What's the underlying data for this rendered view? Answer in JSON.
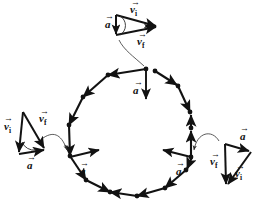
{
  "figure": {
    "width": 259,
    "height": 211,
    "background_color": "#ffffff",
    "ink_color": "#121212",
    "connector_color": "#4a4a4a"
  },
  "path": {
    "shape": "regular-polygon",
    "sides": 16,
    "center_x": 130,
    "center_y": 130,
    "radius": 62,
    "travel_direction": "counterclockwise",
    "edge_arrowheads": true,
    "vertex_dots": true
  },
  "labels": {
    "v_initial": "v",
    "v_initial_sub": "i",
    "v_final": "v",
    "v_final_sub": "f",
    "acceleration": "a",
    "vector_bar": "→"
  },
  "acceleration_markers": [
    {
      "id": "accel-top",
      "position": "top-vertex",
      "label": "a",
      "direction": "down-toward-center",
      "x": 146,
      "y": 70,
      "label_x": 137,
      "label_y": 90
    },
    {
      "id": "accel-left",
      "position": "lower-left-vertex",
      "label": "a",
      "direction": "up-right-toward-center",
      "x": 71,
      "y": 157,
      "label_x": 84,
      "label_y": 176
    },
    {
      "id": "accel-right",
      "position": "lower-right-vertex",
      "label": "a",
      "direction": "up-left-toward-center",
      "x": 190,
      "y": 157,
      "label_x": 180,
      "label_y": 176
    }
  ],
  "vector_triangles": [
    {
      "id": "triangle-top",
      "attached_to": "top-vertex",
      "labels": {
        "v_initial": "v",
        "v_initial_sub": "i",
        "v_final": "v",
        "v_final_sub": "f",
        "acceleration": "a",
        "acceleration_sub": ""
      },
      "label_positions": {
        "v_initial_x": 133,
        "v_initial_y": 11,
        "v_final_x": 143,
        "v_final_y": 43,
        "acceleration_x": 108,
        "acceleration_y": 26
      },
      "geometry": {
        "apex_top_x": 116,
        "apex_top_y": 15,
        "apex_bottom_x": 116,
        "apex_bottom_y": 35,
        "tip_x": 157,
        "tip_y": 26
      }
    },
    {
      "id": "triangle-left",
      "attached_to": "lower-left-vertex",
      "labels": {
        "v_initial": "v",
        "v_initial_sub": "i",
        "v_final": "v",
        "v_final_sub": "f",
        "acceleration": "a"
      },
      "label_positions": {
        "v_initial_x": 8,
        "v_initial_y": 130,
        "v_final_x": 44,
        "v_final_y": 122,
        "acceleration_x": 31,
        "acceleration_y": 168
      },
      "geometry": {
        "apex_x": 23,
        "apex_y": 112,
        "base_left_x": 20,
        "base_left_y": 154,
        "base_right_x": 45,
        "base_right_y": 150
      }
    },
    {
      "id": "triangle-right",
      "attached_to": "lower-right-vertex",
      "labels": {
        "v_initial": "v",
        "v_initial_sub": "i",
        "v_final": "v",
        "v_final_sub": "f",
        "acceleration": "a"
      },
      "label_positions": {
        "v_initial_x": 239,
        "v_initial_y": 177,
        "v_final_x": 217,
        "v_final_y": 165,
        "acceleration_x": 244,
        "acceleration_y": 138
      },
      "geometry": {
        "apex_x": 225,
        "apex_y": 144,
        "base_left_x": 227,
        "base_left_y": 186,
        "base_right_x": 251,
        "base_right_y": 152
      }
    }
  ],
  "connectors": [
    {
      "id": "connector-top",
      "from": "triangle-top",
      "to": "top-vertex",
      "has_arrowhead": false
    },
    {
      "id": "connector-left",
      "from": "triangle-left",
      "to": "lower-left-vertex",
      "has_arrowhead": true
    },
    {
      "id": "connector-right",
      "from": "triangle-right",
      "to": "lower-right-vertex",
      "has_arrowhead": true
    }
  ]
}
